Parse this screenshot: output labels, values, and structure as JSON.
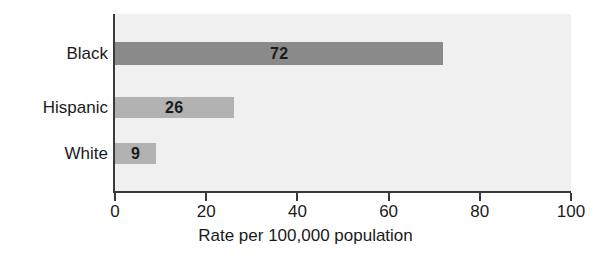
{
  "chart_data": {
    "type": "bar",
    "orientation": "horizontal",
    "title": "",
    "xlabel": "Rate per 100,000 population",
    "ylabel": "",
    "categories": [
      "Black",
      "Hispanic",
      "White"
    ],
    "values": [
      72,
      26,
      9
    ],
    "value_labels": [
      "72",
      "26",
      "9"
    ],
    "bar_colors": [
      "#8a8a8a",
      "#b2b2b2",
      "#b2b2b2"
    ],
    "xlim": [
      0,
      100
    ],
    "xticks": [
      0,
      20,
      40,
      60,
      80,
      100
    ],
    "xtick_labels": [
      "0",
      "20",
      "40",
      "60",
      "80",
      "100"
    ],
    "grid": false,
    "legend": null,
    "plot_background": "#f0f0f0",
    "axis_color": "#3a3a3a"
  }
}
